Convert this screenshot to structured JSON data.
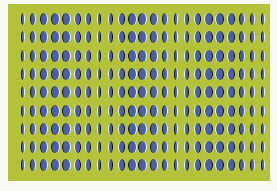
{
  "image": {
    "description": "Rotating ellipses optical illusion",
    "background_color": "#b4c23a",
    "border_color": "#fbfbf6",
    "ellipse_fill": "#4a5fa8",
    "shadow_dark": "#111111",
    "shadow_light": "#f4f4ec",
    "rows": 9,
    "columns": 23,
    "column_widths": [
      3,
      5,
      7,
      8,
      8,
      6,
      5,
      3,
      4,
      6,
      8,
      8,
      7,
      5,
      3,
      4,
      6,
      8,
      8,
      7,
      5,
      4,
      3
    ],
    "ellipse_height": 12
  }
}
